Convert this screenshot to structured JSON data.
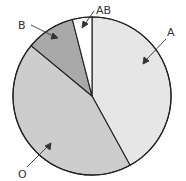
{
  "chart_data": {
    "type": "pie",
    "title": "",
    "categories": [
      "A",
      "O",
      "B",
      "AB"
    ],
    "values": [
      42,
      44,
      10,
      4
    ],
    "unit": "%",
    "start_angle_deg": 0,
    "direction": "clockwise",
    "colors": [
      "#e6e6e6",
      "#cdcdcd",
      "#a9a9a9",
      "#ffffff"
    ],
    "legend": "none (callout labels with arrows)",
    "labels": [
      {
        "text": "A",
        "x": 171,
        "y": 34
      },
      {
        "text": "O",
        "x": 22,
        "y": 177
      },
      {
        "text": "B",
        "x": 22,
        "y": 29
      },
      {
        "text": "AB",
        "x": 99,
        "y": 14
      }
    ]
  }
}
